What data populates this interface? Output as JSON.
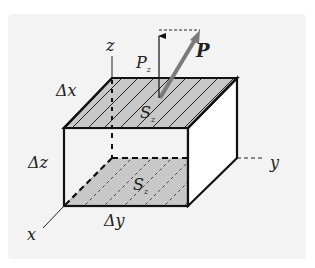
{
  "diagram": {
    "type": "3d-box-with-flux-vector",
    "labels": {
      "axis_x": "x",
      "axis_y": "y",
      "axis_z": "z",
      "delta_x": "Δx",
      "delta_y": "Δy",
      "delta_z": "Δz",
      "vector": "P",
      "component": "P",
      "component_sub": "z",
      "top_surface": "S",
      "top_surface_sub": "z",
      "bottom_surface": "S",
      "bottom_surface_sub": "z"
    },
    "colors": {
      "background": "#f3f3f3",
      "face_fill": "#c8c8c8",
      "edge": "#111111",
      "vector": "#7a7a7a"
    }
  }
}
